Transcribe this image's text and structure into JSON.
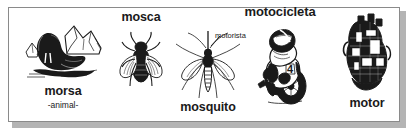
{
  "panel": {
    "border_color": "#8a8a8a",
    "shadow_color": "#b4b4b4",
    "background_color": "#ffffff",
    "ink_color": "#1a1a1a"
  },
  "items": [
    {
      "key": "morsa",
      "label": "morsa",
      "sublabel": "-animal-",
      "illustration": "walrus-illustration"
    },
    {
      "key": "mosca",
      "label": "mosca",
      "illustration": "fly-illustration"
    },
    {
      "key": "mosquito",
      "label": "mosquito",
      "illustration": "mosquito-illustration"
    },
    {
      "key": "motocicleta",
      "label": "motocicleta",
      "callout": "motorista",
      "illustration": "motorcycle-illustration"
    },
    {
      "key": "motor",
      "label": "motor",
      "illustration": "engine-illustration"
    }
  ]
}
